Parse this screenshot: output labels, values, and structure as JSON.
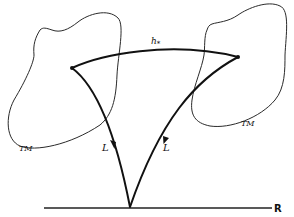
{
  "diagram": {
    "labels": {
      "h_star": "h",
      "h_star_sub": "*",
      "left_tm": "TM",
      "right_tm": "TM",
      "left_L": "L",
      "right_L": "L",
      "real_line": "R"
    },
    "points": {
      "left_node": [
        72,
        68
      ],
      "right_node": [
        238,
        57
      ],
      "bottom_vertex": [
        130,
        207
      ]
    },
    "colors": {
      "stroke": "#111111",
      "background": "#ffffff"
    }
  }
}
